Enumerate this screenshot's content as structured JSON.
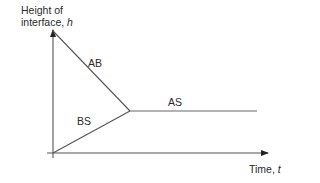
{
  "diagram": {
    "type": "phase-plot",
    "y_axis": {
      "label_line1": "Height of",
      "label_line2_prefix": "interface, ",
      "label_symbol": "h"
    },
    "x_axis": {
      "label_prefix": "Time, ",
      "label_symbol": "t"
    },
    "regions": [
      {
        "id": "AB",
        "label": "AB"
      },
      {
        "id": "BS",
        "label": "BS"
      },
      {
        "id": "AS",
        "label": "AS"
      }
    ],
    "line_color": "#555555",
    "geometry": {
      "origin": [
        53,
        153
      ],
      "y_axis_top": [
        53,
        29
      ],
      "x_axis_end": [
        268,
        153
      ],
      "ab_line": [
        [
          53,
          31
        ],
        [
          130,
          111
        ]
      ],
      "bs_line": [
        [
          53,
          153
        ],
        [
          130,
          111
        ]
      ],
      "as_line": [
        [
          130,
          111
        ],
        [
          257,
          111
        ]
      ]
    }
  }
}
